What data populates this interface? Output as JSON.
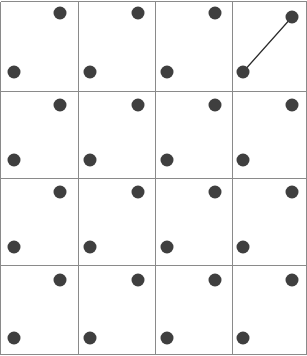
{
  "figure": {
    "title": "",
    "width": 307,
    "height": 356,
    "background_color": "#ffffff"
  },
  "grid": {
    "rows": 4,
    "cols": 4,
    "line_color": "#8a8a8a",
    "line_width": 1,
    "border_color": "#8a8a8a",
    "vertical_lines_x": [
      0.5,
      78,
      155,
      232,
      306.5
    ],
    "horizontal_lines_y": [
      1.5,
      91,
      178,
      265,
      354.5
    ]
  },
  "dots": {
    "color": "#3f3f3f",
    "radius": 6.5,
    "count": 32,
    "positions": [
      {
        "id": "r1c1-upper-right",
        "x": 60,
        "y": 13
      },
      {
        "id": "r1c1-lower-left",
        "x": 14,
        "y": 72
      },
      {
        "id": "r1c2-upper-right",
        "x": 138,
        "y": 13
      },
      {
        "id": "r1c2-lower-left",
        "x": 90,
        "y": 72
      },
      {
        "id": "r1c3-upper-right",
        "x": 215,
        "y": 13
      },
      {
        "id": "r1c3-lower-left",
        "x": 167,
        "y": 72
      },
      {
        "id": "r1c4-upper-right",
        "x": 292,
        "y": 17
      },
      {
        "id": "r1c4-lower-left",
        "x": 243,
        "y": 72
      },
      {
        "id": "r2c1-upper-right",
        "x": 60,
        "y": 105
      },
      {
        "id": "r2c1-lower-left",
        "x": 14,
        "y": 160
      },
      {
        "id": "r2c2-upper-right",
        "x": 138,
        "y": 105
      },
      {
        "id": "r2c2-lower-left",
        "x": 90,
        "y": 160
      },
      {
        "id": "r2c3-upper-right",
        "x": 215,
        "y": 105
      },
      {
        "id": "r2c3-lower-left",
        "x": 167,
        "y": 160
      },
      {
        "id": "r2c4-upper-right",
        "x": 292,
        "y": 105
      },
      {
        "id": "r2c4-lower-left",
        "x": 243,
        "y": 160
      },
      {
        "id": "r3c1-upper-right",
        "x": 60,
        "y": 192
      },
      {
        "id": "r3c1-lower-left",
        "x": 14,
        "y": 247
      },
      {
        "id": "r3c2-upper-right",
        "x": 138,
        "y": 192
      },
      {
        "id": "r3c2-lower-left",
        "x": 90,
        "y": 247
      },
      {
        "id": "r3c3-upper-right",
        "x": 215,
        "y": 192
      },
      {
        "id": "r3c3-lower-left",
        "x": 167,
        "y": 247
      },
      {
        "id": "r3c4-upper-right",
        "x": 292,
        "y": 192
      },
      {
        "id": "r3c4-lower-left",
        "x": 243,
        "y": 247
      },
      {
        "id": "r4c1-upper-right",
        "x": 60,
        "y": 280
      },
      {
        "id": "r4c1-lower-left",
        "x": 14,
        "y": 338
      },
      {
        "id": "r4c2-upper-right",
        "x": 138,
        "y": 280
      },
      {
        "id": "r4c2-lower-left",
        "x": 90,
        "y": 338
      },
      {
        "id": "r4c3-upper-right",
        "x": 215,
        "y": 280
      },
      {
        "id": "r4c3-lower-left",
        "x": 167,
        "y": 338
      },
      {
        "id": "r4c4-upper-right",
        "x": 292,
        "y": 280
      },
      {
        "id": "r4c4-lower-left",
        "x": 243,
        "y": 338
      }
    ]
  },
  "bonds": {
    "color": "#2b2b2b",
    "width": 1.2,
    "count": 1,
    "segments": [
      {
        "id": "bond-r1c4",
        "from": "r1c4-lower-left",
        "to": "r1c4-upper-right",
        "x1": 243,
        "y1": 72,
        "x2": 292,
        "y2": 17
      }
    ]
  }
}
